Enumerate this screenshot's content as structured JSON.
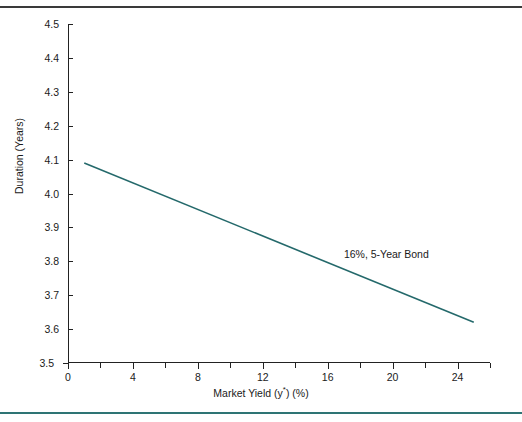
{
  "figure": {
    "background_color": "#ffffff",
    "rule_top_color": "#3a3a3a",
    "rule_bottom_color": "#2e7474"
  },
  "chart_data": {
    "type": "line",
    "title": "",
    "subtitle": "",
    "xlabel_prefix": "Market Yield  (y",
    "xlabel_sup": "*",
    "xlabel_suffix": ") (%)",
    "xlabel": "Market Yield  (y*) (%)",
    "ylabel": "Duration (Years)",
    "xlim": [
      0,
      26
    ],
    "ylim": [
      3.5,
      4.5
    ],
    "grid": false,
    "legend": null,
    "legend_position": "none",
    "line_color": "#24696b",
    "line_width": 1.6,
    "x_major_ticks": [
      0,
      4,
      8,
      12,
      16,
      20,
      24
    ],
    "x_major_tick_labels": [
      "0",
      "4",
      "8",
      "12",
      "16",
      "20",
      "24"
    ],
    "x_minor_ticks": [
      2,
      6,
      10,
      14,
      18,
      22,
      26
    ],
    "y_ticks": [
      3.5,
      3.6,
      3.7,
      3.8,
      3.9,
      4.0,
      4.1,
      4.2,
      4.3,
      4.4,
      4.5
    ],
    "y_tick_labels": [
      "3.5",
      "3.6",
      "3.7",
      "3.8",
      "3.9",
      "4.0",
      "4.1",
      "4.2",
      "4.3",
      "4.4",
      "4.5"
    ],
    "series": [
      {
        "name": "16%, 5-Year Bond",
        "x": [
          1,
          25
        ],
        "y": [
          4.09,
          3.62
        ]
      }
    ],
    "annotations": [
      {
        "text": "16%, 5-Year Bond",
        "x": 17.0,
        "y": 3.82
      }
    ]
  }
}
